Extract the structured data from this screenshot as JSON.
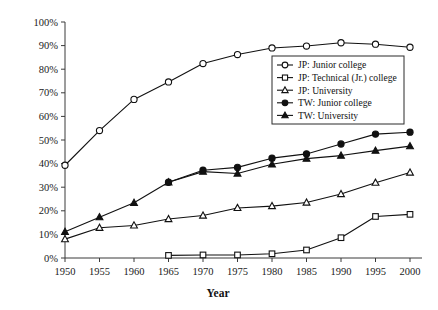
{
  "chart_data": {
    "type": "line",
    "title": "",
    "xlabel": "Year",
    "ylabel": "",
    "x": [
      1950,
      1955,
      1960,
      1965,
      1970,
      1975,
      1980,
      1985,
      1990,
      1995,
      2000
    ],
    "categories": [
      "1950",
      "1955",
      "1960",
      "1965",
      "1970",
      "1975",
      "1980",
      "1985",
      "1990",
      "1995",
      "2000"
    ],
    "xlim": [
      1950,
      2000
    ],
    "ylim": [
      0,
      100
    ],
    "yticks": [
      0,
      10,
      20,
      30,
      40,
      50,
      60,
      70,
      80,
      90,
      100
    ],
    "ytick_labels": [
      "0%",
      "10%",
      "20%",
      "30%",
      "40%",
      "50%",
      "60%",
      "70%",
      "80%",
      "90%",
      "100%"
    ],
    "grid": false,
    "legend_position": "upper-right-inside",
    "series": [
      {
        "name": "JP: Junior college",
        "marker": "open-circle",
        "values": [
          39.3,
          54.0,
          67.2,
          74.6,
          82.4,
          86.2,
          89.0,
          89.8,
          91.2,
          90.6,
          89.3
        ]
      },
      {
        "name": "JP: Technical (Jr.) college",
        "marker": "open-square",
        "values": [
          null,
          null,
          null,
          1.1,
          1.3,
          1.3,
          1.8,
          3.4,
          8.6,
          17.6,
          18.5
        ]
      },
      {
        "name": "JP: University",
        "marker": "open-triangle",
        "values": [
          8.0,
          12.8,
          13.8,
          16.5,
          18.0,
          21.2,
          22.0,
          23.5,
          27.1,
          31.9,
          36.2
        ]
      },
      {
        "name": "TW: Junior college",
        "marker": "filled-circle",
        "values": [
          null,
          null,
          null,
          32.1,
          37.2,
          38.4,
          42.3,
          44.1,
          48.3,
          52.5,
          53.3
        ]
      },
      {
        "name": "TW: University",
        "marker": "filled-triangle",
        "values": [
          11.1,
          17.3,
          23.4,
          32.1,
          36.6,
          35.8,
          39.7,
          42.1,
          43.4,
          45.5,
          47.4
        ]
      }
    ]
  },
  "legend": {
    "items": [
      {
        "label": "JP: Junior college",
        "marker": "open-circle"
      },
      {
        "label": "JP: Technical (Jr.) college",
        "marker": "open-square"
      },
      {
        "label": "JP: University",
        "marker": "open-triangle"
      },
      {
        "label": "TW: Junior college",
        "marker": "filled-circle"
      },
      {
        "label": "TW: University",
        "marker": "filled-triangle"
      }
    ]
  },
  "colors": {
    "ink": "#111111",
    "axis": "#3a3a3a",
    "background": "#ffffff"
  }
}
